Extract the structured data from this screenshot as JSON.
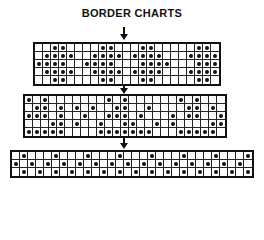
{
  "title": "BORDER CHARTS",
  "colors": {
    "ink": "#111111",
    "paper": "#ffffff"
  },
  "charts": [
    {
      "name": "chart-1",
      "left": 33,
      "top": 42,
      "cols": 23,
      "rows": 5,
      "cell": 8,
      "dots": [
        [
          2,
          3,
          8,
          9,
          13,
          14,
          20,
          21
        ],
        [
          1,
          2,
          3,
          4,
          7,
          8,
          9,
          10,
          12,
          13,
          14,
          15,
          19,
          20,
          21,
          22
        ],
        [
          0,
          1,
          2,
          3,
          6,
          7,
          8,
          9,
          13,
          14,
          15,
          16,
          20,
          21,
          22
        ],
        [
          1,
          2,
          3,
          4,
          7,
          8,
          9,
          10,
          12,
          13,
          14,
          15,
          19,
          20,
          21,
          22
        ],
        [
          2,
          3,
          8,
          9,
          13,
          14,
          20,
          21
        ]
      ]
    },
    {
      "name": "chart-2",
      "left": 23,
      "top": 94,
      "cols": 25,
      "rows": 5,
      "cell": 8,
      "dots": [
        [
          0,
          2,
          10,
          12,
          19,
          21
        ],
        [
          1,
          2,
          4,
          6,
          8,
          11,
          12,
          15,
          20,
          21,
          23
        ],
        [
          0,
          1,
          2,
          4,
          7,
          10,
          11,
          12,
          14,
          18,
          20,
          21,
          24
        ],
        [
          3,
          4,
          6,
          9,
          12,
          13,
          16,
          18,
          23,
          24
        ],
        [
          0,
          1,
          2,
          3,
          4,
          9,
          10,
          11,
          12,
          13,
          14,
          15,
          19,
          20,
          21,
          22,
          23
        ]
      ]
    },
    {
      "name": "chart-3",
      "left": 10,
      "top": 150,
      "cols": 30,
      "rows": 3,
      "cell": 8,
      "dots": [
        [
          1,
          5,
          9,
          13,
          17,
          21,
          25,
          29
        ],
        [
          0,
          2,
          4,
          6,
          8,
          10,
          12,
          14,
          16,
          18,
          20,
          22,
          24,
          26,
          28
        ],
        [
          1,
          3,
          5,
          7,
          9,
          11,
          13,
          15,
          17,
          19,
          21,
          23,
          25,
          27,
          29
        ]
      ]
    }
  ],
  "arrows": [
    {
      "x": 124,
      "top": 27,
      "height": 13
    },
    {
      "x": 124,
      "top": 82,
      "height": 12
    },
    {
      "x": 124,
      "top": 137,
      "height": 12
    }
  ]
}
